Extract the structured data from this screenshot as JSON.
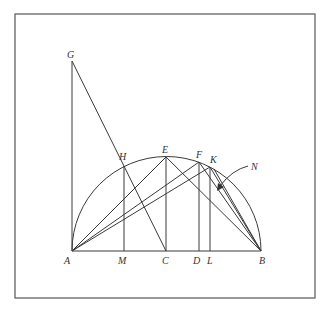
{
  "diagram": {
    "frame": {
      "x": 15,
      "y": 14,
      "w": 300,
      "h": 284
    },
    "semicircle": {
      "cx": 166.5,
      "cy": 251,
      "r": 94.5
    },
    "points": {
      "A": {
        "x": 72,
        "y": 251,
        "label": "A",
        "lx": 64,
        "ly": 264
      },
      "M": {
        "x": 124,
        "y": 251,
        "label": "M",
        "lx": 118,
        "ly": 264
      },
      "C": {
        "x": 166,
        "y": 251,
        "label": "C",
        "lx": 162,
        "ly": 264
      },
      "D": {
        "x": 199,
        "y": 251,
        "label": "D",
        "lx": 193,
        "ly": 264
      },
      "L": {
        "x": 210,
        "y": 251,
        "label": "L",
        "lx": 207,
        "ly": 264
      },
      "B": {
        "x": 261,
        "y": 251,
        "label": "B",
        "lx": 259,
        "ly": 264
      },
      "G": {
        "x": 72,
        "y": 61,
        "label": "G",
        "lx": 67,
        "ly": 58
      },
      "H": {
        "x": 124,
        "y": 166,
        "label": "H",
        "lx": 119,
        "ly": 160
      },
      "E": {
        "x": 166,
        "y": 157,
        "label": "E",
        "lx": 162,
        "ly": 153
      },
      "F": {
        "x": 199,
        "y": 162,
        "label": "F",
        "lx": 196,
        "ly": 158
      },
      "K": {
        "x": 210,
        "y": 167,
        "label": "K",
        "lx": 210,
        "ly": 163
      },
      "N": {
        "label": "N",
        "lx": 251,
        "ly": 170
      }
    },
    "segments": [
      [
        "A",
        "B"
      ],
      [
        "G",
        "A"
      ],
      [
        "G",
        "C"
      ],
      [
        "H",
        "M"
      ],
      [
        "E",
        "C"
      ],
      [
        "F",
        "D"
      ],
      [
        "K",
        "L"
      ],
      [
        "A",
        "E"
      ],
      [
        "A",
        "F"
      ],
      [
        "A",
        "K"
      ],
      [
        "E",
        "B"
      ],
      [
        "F",
        "B"
      ],
      [
        "K",
        "B"
      ]
    ],
    "labels": [
      "A",
      "M",
      "C",
      "D",
      "L",
      "B",
      "G",
      "H",
      "E",
      "F",
      "K",
      "N"
    ]
  }
}
